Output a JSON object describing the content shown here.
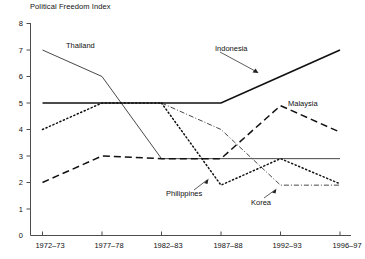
{
  "chart_data": {
    "type": "line",
    "title": "Political Freedom Index",
    "xlabel": "",
    "ylabel": "",
    "ylim": [
      0,
      8
    ],
    "yticks": [
      0,
      1,
      2,
      3,
      4,
      5,
      6,
      7,
      8
    ],
    "grid": false,
    "legend": "inline-annotations",
    "categories": [
      "1972–73",
      "1977–78",
      "1982–83",
      "1987–88",
      "1992–93",
      "1996–97"
    ],
    "series": [
      {
        "name": "Indonesia",
        "style": "solid-thick",
        "values": [
          5,
          5,
          5,
          5,
          6,
          7
        ]
      },
      {
        "name": "Thailand",
        "style": "solid-thin",
        "values": [
          7,
          6,
          2.9,
          2.9,
          2.9,
          2.9
        ]
      },
      {
        "name": "Malaysia",
        "style": "dashed",
        "values": [
          2,
          3,
          2.9,
          2.9,
          4.9,
          3.9
        ]
      },
      {
        "name": "Korea",
        "style": "dotted-then-dash-dot",
        "values": [
          4,
          5,
          5,
          4,
          1.9,
          1.9
        ]
      },
      {
        "name": "Philippines",
        "style": "dotted",
        "values": [
          null,
          null,
          5,
          1.9,
          2.9,
          1.95
        ]
      }
    ],
    "annotations": [
      {
        "text": "Thailand",
        "arrow": false
      },
      {
        "text": "Indonesia",
        "arrow": true
      },
      {
        "text": "Malaysia",
        "arrow": false
      },
      {
        "text": "Philippines",
        "arrow": true
      },
      {
        "text": "Korea",
        "arrow": true
      }
    ]
  },
  "axis": {
    "y_tick_labels": [
      "8",
      "7",
      "6",
      "5",
      "4",
      "3",
      "2",
      "1",
      "0"
    ],
    "x_tick_labels": [
      "1972–73",
      "1977–78",
      "1982–83",
      "1987–88",
      "1992–93",
      "1996–97"
    ]
  },
  "labels": {
    "thailand": "Thailand",
    "indonesia": "Indonesia",
    "malaysia": "Malaysia",
    "philippines": "Philippines",
    "korea": "Korea"
  }
}
